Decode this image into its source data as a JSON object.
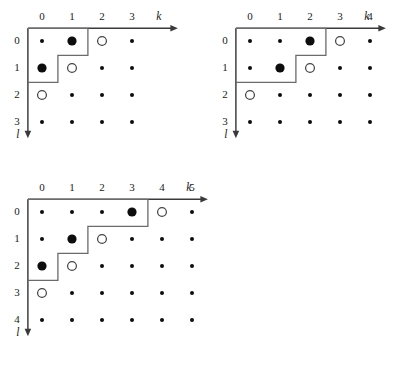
{
  "figure": {
    "type": "lattice-young-diagram-set",
    "background_color": "#ffffff",
    "marker_colors": {
      "filled": "#0d0d0d",
      "open_fill": "#ffffff",
      "open_stroke": "#454545",
      "axis": "#3a3a3a",
      "boundary": "#6b6b6b"
    },
    "axis_labels": {
      "horizontal": "k",
      "vertical": "l"
    }
  },
  "panels": [
    {
      "id": "panel-1",
      "origin": {
        "x": 42,
        "y": 41
      },
      "step": {
        "x": 30,
        "y": 27
      },
      "k_ticks": [
        "0",
        "1",
        "2",
        "3"
      ],
      "l_ticks": [
        "0",
        "1",
        "2",
        "3"
      ],
      "k_label": "k",
      "l_label": "l",
      "k_axis_length": 150,
      "l_axis_length": 110,
      "partition": [
        2,
        1
      ],
      "markers": [
        {
          "k": 1,
          "l": 0,
          "type": "filled-large"
        },
        {
          "k": 2,
          "l": 0,
          "type": "open-large"
        },
        {
          "k": 0,
          "l": 1,
          "type": "filled-large"
        },
        {
          "k": 1,
          "l": 1,
          "type": "open-large"
        },
        {
          "k": 0,
          "l": 2,
          "type": "open-large"
        }
      ]
    },
    {
      "id": "panel-2",
      "origin": {
        "x": 250,
        "y": 41
      },
      "step": {
        "x": 30,
        "y": 27
      },
      "k_ticks": [
        "0",
        "1",
        "2",
        "3",
        "4"
      ],
      "l_ticks": [
        "0",
        "1",
        "2",
        "3"
      ],
      "k_label": "k",
      "l_label": "l",
      "k_axis_length": 150,
      "l_axis_length": 110,
      "partition": [
        3,
        2
      ],
      "markers": [
        {
          "k": 2,
          "l": 0,
          "type": "filled-large"
        },
        {
          "k": 3,
          "l": 0,
          "type": "open-large"
        },
        {
          "k": 1,
          "l": 1,
          "type": "filled-large"
        },
        {
          "k": 2,
          "l": 1,
          "type": "open-large"
        },
        {
          "k": 0,
          "l": 2,
          "type": "open-large"
        }
      ]
    },
    {
      "id": "panel-3",
      "origin": {
        "x": 42,
        "y": 212
      },
      "step": {
        "x": 30,
        "y": 27
      },
      "k_ticks": [
        "0",
        "1",
        "2",
        "3",
        "4",
        "5"
      ],
      "l_ticks": [
        "0",
        "1",
        "2",
        "3",
        "4"
      ],
      "k_label": "k",
      "l_label": "l",
      "k_axis_length": 180,
      "l_axis_length": 137,
      "partition": [
        4,
        2,
        1
      ],
      "markers": [
        {
          "k": 3,
          "l": 0,
          "type": "filled-large"
        },
        {
          "k": 4,
          "l": 0,
          "type": "open-large"
        },
        {
          "k": 1,
          "l": 1,
          "type": "filled-large"
        },
        {
          "k": 2,
          "l": 1,
          "type": "open-large"
        },
        {
          "k": 0,
          "l": 2,
          "type": "filled-large"
        },
        {
          "k": 1,
          "l": 2,
          "type": "open-large"
        },
        {
          "k": 0,
          "l": 3,
          "type": "open-large"
        }
      ]
    }
  ],
  "marker_sizes": {
    "small_radius": 2.0,
    "large_radius": 4.6,
    "open_radius": 4.4
  }
}
